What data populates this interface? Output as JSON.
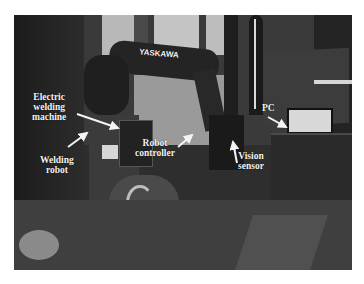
{
  "figure": {
    "robot_brand": "YASKAWA",
    "labels": [
      {
        "id": "electric-welding-machine",
        "text": "Electric\nwelding\nmachine"
      },
      {
        "id": "welding-robot",
        "text": "Welding\nrobot"
      },
      {
        "id": "robot-controller",
        "text": "Robot\ncontroller"
      },
      {
        "id": "vision-sensor",
        "text": "Vision\nsensor"
      },
      {
        "id": "pc",
        "text": "PC"
      }
    ],
    "colors": {
      "background": "#ffffff",
      "label_text": "#f4f4f4",
      "arrow": "#f4f4f4"
    }
  }
}
